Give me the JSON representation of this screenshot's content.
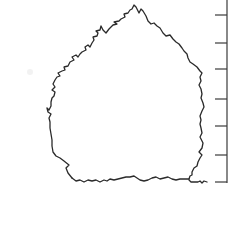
{
  "figure": {
    "colors": {
      "background": "#ffffff",
      "stroke": "#2a2a2a",
      "scale": "#3a3a3a"
    },
    "stroke_width": 1.3
  },
  "outline": {
    "points": [
      [
        72,
        178
      ],
      [
        68,
        173
      ],
      [
        66,
        168
      ],
      [
        69,
        165
      ],
      [
        64,
        161
      ],
      [
        60,
        158
      ],
      [
        56,
        156
      ],
      [
        53,
        152
      ],
      [
        52,
        146
      ],
      [
        52,
        140
      ],
      [
        51,
        134
      ],
      [
        50,
        128
      ],
      [
        50,
        122
      ],
      [
        49,
        118
      ],
      [
        51,
        114
      ],
      [
        48,
        112
      ],
      [
        47,
        108
      ],
      [
        49,
        110
      ],
      [
        51,
        106
      ],
      [
        51,
        102
      ],
      [
        52,
        98
      ],
      [
        54,
        96
      ],
      [
        55,
        92
      ],
      [
        52,
        90
      ],
      [
        55,
        87
      ],
      [
        53,
        84
      ],
      [
        55,
        80
      ],
      [
        57,
        77
      ],
      [
        60,
        76
      ],
      [
        58,
        73
      ],
      [
        62,
        71
      ],
      [
        65,
        70
      ],
      [
        64,
        67
      ],
      [
        68,
        66
      ],
      [
        70,
        62
      ],
      [
        74,
        60
      ],
      [
        72,
        57
      ],
      [
        76,
        55
      ],
      [
        78,
        57
      ],
      [
        80,
        54
      ],
      [
        82,
        52
      ],
      [
        86,
        50
      ],
      [
        85,
        47
      ],
      [
        88,
        45
      ],
      [
        90,
        47
      ],
      [
        92,
        43
      ],
      [
        94,
        40
      ],
      [
        93,
        37
      ],
      [
        97,
        36
      ],
      [
        98,
        33
      ],
      [
        96,
        31
      ],
      [
        100,
        30
      ],
      [
        101,
        26
      ],
      [
        103,
        30
      ],
      [
        106,
        33
      ],
      [
        109,
        29
      ],
      [
        111,
        27
      ],
      [
        113,
        25
      ],
      [
        117,
        24
      ],
      [
        114,
        22
      ],
      [
        119,
        21
      ],
      [
        121,
        19
      ],
      [
        125,
        17
      ],
      [
        124,
        14
      ],
      [
        128,
        13
      ],
      [
        130,
        10
      ],
      [
        132,
        9
      ],
      [
        134,
        5
      ],
      [
        136,
        7
      ],
      [
        138,
        11
      ],
      [
        139,
        13
      ],
      [
        141,
        9
      ],
      [
        143,
        11
      ],
      [
        146,
        16
      ],
      [
        148,
        21
      ],
      [
        151,
        24
      ],
      [
        154,
        23
      ],
      [
        157,
        26
      ],
      [
        160,
        28
      ],
      [
        163,
        33
      ],
      [
        166,
        36
      ],
      [
        170,
        35
      ],
      [
        173,
        39
      ],
      [
        176,
        42
      ],
      [
        179,
        44
      ],
      [
        182,
        48
      ],
      [
        184,
        51
      ],
      [
        187,
        54
      ],
      [
        188,
        58
      ],
      [
        190,
        62
      ],
      [
        193,
        64
      ],
      [
        197,
        67
      ],
      [
        200,
        71
      ],
      [
        202,
        73
      ],
      [
        200,
        77
      ],
      [
        201,
        81
      ],
      [
        199,
        85
      ],
      [
        201,
        89
      ],
      [
        202,
        94
      ],
      [
        201,
        98
      ],
      [
        203,
        103
      ],
      [
        204,
        107
      ],
      [
        202,
        111
      ],
      [
        200,
        116
      ],
      [
        201,
        120
      ],
      [
        200,
        124
      ],
      [
        201,
        128
      ],
      [
        202,
        133
      ],
      [
        200,
        137
      ],
      [
        203,
        143
      ],
      [
        202,
        148
      ],
      [
        199,
        152
      ],
      [
        202,
        155
      ],
      [
        200,
        158
      ],
      [
        198,
        162
      ],
      [
        197,
        166
      ],
      [
        194,
        168
      ],
      [
        192,
        172
      ],
      [
        192,
        175
      ],
      [
        190,
        176
      ],
      [
        189,
        179
      ]
    ],
    "bottom_edge": [
      [
        72,
        178
      ],
      [
        76,
        181
      ],
      [
        80,
        180
      ],
      [
        84,
        182
      ],
      [
        88,
        180
      ],
      [
        92,
        181
      ],
      [
        96,
        180
      ],
      [
        100,
        182
      ],
      [
        104,
        180
      ],
      [
        107,
        181
      ],
      [
        110,
        179
      ],
      [
        114,
        180
      ],
      [
        118,
        179
      ],
      [
        122,
        178
      ],
      [
        126,
        177
      ],
      [
        130,
        177
      ],
      [
        134,
        176
      ],
      [
        137,
        178
      ],
      [
        140,
        180
      ],
      [
        144,
        181
      ],
      [
        148,
        180
      ],
      [
        152,
        178
      ],
      [
        156,
        177
      ],
      [
        160,
        179
      ],
      [
        164,
        178
      ],
      [
        168,
        177
      ],
      [
        172,
        179
      ],
      [
        176,
        180
      ],
      [
        180,
        179
      ],
      [
        184,
        179
      ],
      [
        189,
        179
      ]
    ],
    "tail": [
      [
        189,
        180
      ],
      [
        191,
        182
      ],
      [
        195,
        182
      ],
      [
        198,
        182
      ],
      [
        200,
        181
      ],
      [
        202,
        183
      ],
      [
        204,
        181
      ],
      [
        207,
        182
      ]
    ]
  },
  "scale": {
    "x": 227,
    "y_top": 0,
    "y_bottom": 183,
    "tick_length": 12,
    "ticks_y": [
      15,
      43,
      69,
      99,
      126,
      155,
      182
    ]
  },
  "smudge": {
    "cx": 30,
    "cy": 72,
    "r": 3
  }
}
